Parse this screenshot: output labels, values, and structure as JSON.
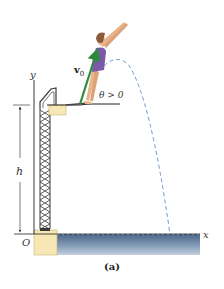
{
  "figure": {
    "caption": "(a)",
    "labels": {
      "y_axis": "y",
      "x_axis": "x",
      "origin": "O",
      "height": "h",
      "velocity_main": "v",
      "velocity_sub": "0",
      "angle": "θ > 0"
    },
    "colors": {
      "velocity_arrow": "#2e8b3e",
      "trajectory": "#5b8fc7",
      "water_top": "#4a6588",
      "water_bottom": "#c4d0de",
      "block": "#f6e7b4",
      "block_stroke": "#c9b47a",
      "tower": "#3a3a3a",
      "swimsuit": "#7a5aa8",
      "skin": "#e8b48a",
      "hair": "#8b5a3a"
    }
  }
}
